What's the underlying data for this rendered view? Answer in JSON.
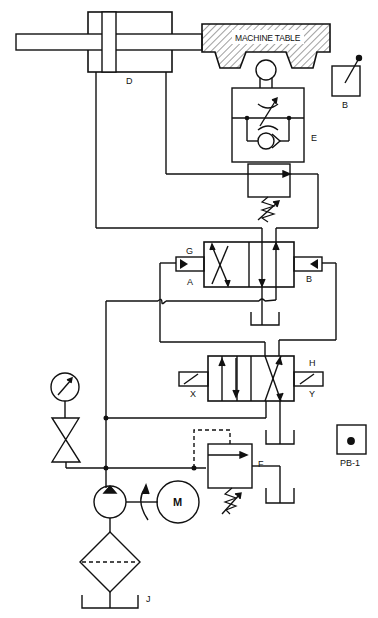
{
  "diagram": {
    "type": "hydraulic-circuit",
    "colors": {
      "line": "#111111",
      "background": "#ffffff"
    },
    "components": {
      "cylinder": {
        "label": "D"
      },
      "machine_table": {
        "label": "MACHINE TABLE"
      },
      "limit_switch": {
        "label": "B"
      },
      "flow_control_check": {
        "label": "E"
      },
      "pilot_valve": {
        "label_top": "G",
        "pilot_a": "A",
        "pilot_b": "B"
      },
      "solenoid_valve": {
        "label_top": "H",
        "solenoid_x": "X",
        "solenoid_y": "Y"
      },
      "relief_valve": {
        "label": "F"
      },
      "push_button": {
        "label": "PB-1"
      },
      "motor": {
        "label": "M"
      },
      "filter": {
        "label": "J"
      }
    }
  }
}
